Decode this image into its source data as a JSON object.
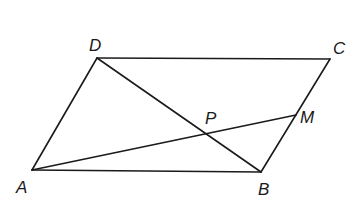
{
  "diagram": {
    "type": "geometry",
    "shape": "parallelogram",
    "points": {
      "A": {
        "label": "A",
        "x": 32,
        "y": 170,
        "lx": 16,
        "ly": 193
      },
      "B": {
        "label": "B",
        "x": 261,
        "y": 172,
        "lx": 258,
        "ly": 195
      },
      "C": {
        "label": "C",
        "x": 330,
        "y": 59,
        "lx": 333,
        "ly": 54
      },
      "D": {
        "label": "D",
        "x": 97,
        "y": 58,
        "lx": 89,
        "ly": 51
      },
      "M": {
        "label": "M",
        "x": 296,
        "y": 115,
        "lx": 300,
        "ly": 123
      },
      "P": {
        "label": "P",
        "x": 207,
        "y": 131,
        "lx": 205,
        "ly": 124
      }
    },
    "segments": [
      {
        "from": "A",
        "to": "B"
      },
      {
        "from": "B",
        "to": "C"
      },
      {
        "from": "C",
        "to": "D"
      },
      {
        "from": "D",
        "to": "A"
      },
      {
        "from": "D",
        "to": "B"
      },
      {
        "from": "A",
        "to": "M"
      }
    ],
    "colors": {
      "line": "#1a1a1a",
      "background": "#ffffff"
    }
  }
}
